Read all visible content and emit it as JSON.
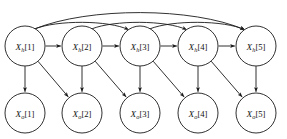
{
  "diagram": {
    "colors": {
      "background": "#ffffff",
      "stroke": "#1a1a1a",
      "node_fill": "#ffffff",
      "label": "#111111"
    },
    "geometry": {
      "width": 287,
      "height": 139,
      "node_radius": 20,
      "hidden_row_y": 46,
      "output_row_y": 113,
      "column_x": [
        25,
        82,
        140,
        198,
        256
      ]
    },
    "hidden_nodes": [
      {
        "id": "xh1",
        "var": "X",
        "sub": "h",
        "index": "[1]",
        "label": "X_h[1]",
        "cx": 25,
        "cy": 46
      },
      {
        "id": "xh2",
        "var": "X",
        "sub": "h",
        "index": "[2]",
        "label": "X_h[2]",
        "cx": 82,
        "cy": 46
      },
      {
        "id": "xh3",
        "var": "X",
        "sub": "h",
        "index": "[3]",
        "label": "X_h[3]",
        "cx": 140,
        "cy": 46
      },
      {
        "id": "xh4",
        "var": "X",
        "sub": "h",
        "index": "[4]",
        "label": "X_h[4]",
        "cx": 198,
        "cy": 46
      },
      {
        "id": "xh5",
        "var": "X",
        "sub": "h",
        "index": "[5]",
        "label": "X_h[5]",
        "cx": 256,
        "cy": 46
      }
    ],
    "output_nodes": [
      {
        "id": "xo1",
        "var": "X",
        "sub": "o",
        "index": "[1]",
        "label": "X_o[1]",
        "cx": 25,
        "cy": 113
      },
      {
        "id": "xo2",
        "var": "X",
        "sub": "o",
        "index": "[2]",
        "label": "X_o[2]",
        "cx": 82,
        "cy": 113
      },
      {
        "id": "xo3",
        "var": "X",
        "sub": "o",
        "index": "[3]",
        "label": "X_o[3]",
        "cx": 140,
        "cy": 113
      },
      {
        "id": "xo4",
        "var": "X",
        "sub": "o",
        "index": "[4]",
        "label": "X_o[4]",
        "cx": 198,
        "cy": 113
      },
      {
        "id": "xo5",
        "var": "X",
        "sub": "o",
        "index": "[5]",
        "label": "X_o[5]",
        "cx": 256,
        "cy": 113
      }
    ],
    "edges": {
      "chain": [
        {
          "from": "xh1",
          "to": "xh2"
        },
        {
          "from": "xh2",
          "to": "xh3"
        },
        {
          "from": "xh3",
          "to": "xh4"
        },
        {
          "from": "xh4",
          "to": "xh5"
        }
      ],
      "skip_arcs": [
        {
          "from": "xh1",
          "to": "xh3",
          "peak_y": 20
        },
        {
          "from": "xh2",
          "to": "xh4",
          "peak_y": 20
        },
        {
          "from": "xh3",
          "to": "xh5",
          "peak_y": 20
        },
        {
          "from": "xh1",
          "to": "xh5",
          "peak_y": 7
        }
      ],
      "emission_vertical": [
        {
          "from": "xh1",
          "to": "xo1"
        },
        {
          "from": "xh2",
          "to": "xo2"
        },
        {
          "from": "xh3",
          "to": "xo3"
        },
        {
          "from": "xh4",
          "to": "xo4"
        },
        {
          "from": "xh5",
          "to": "xo5"
        }
      ],
      "emission_diagonal": [
        {
          "from": "xh1",
          "to": "xo2"
        },
        {
          "from": "xh2",
          "to": "xo3"
        },
        {
          "from": "xh3",
          "to": "xo4"
        },
        {
          "from": "xh4",
          "to": "xo5"
        }
      ]
    }
  }
}
